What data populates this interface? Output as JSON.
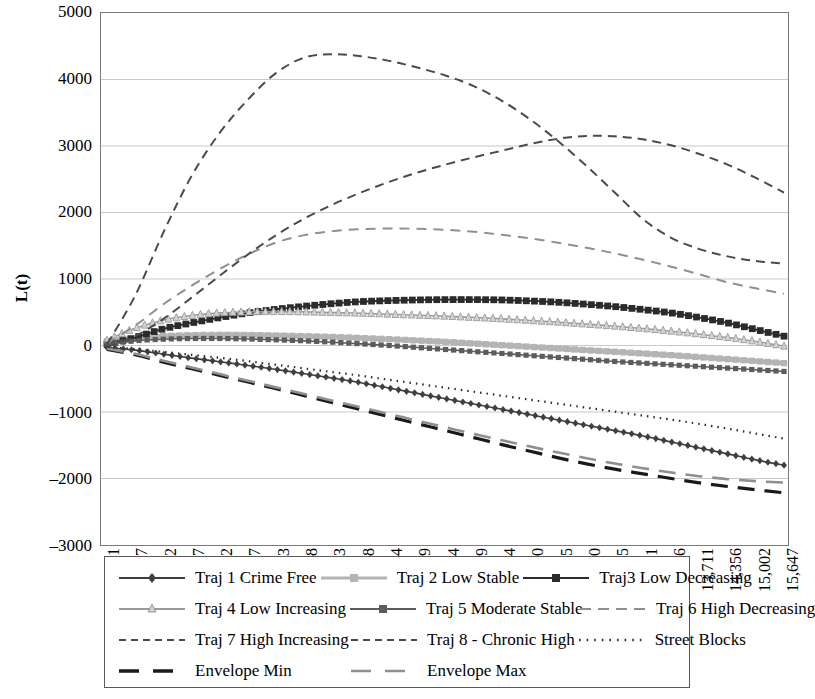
{
  "axis": {
    "y_title": "L(t)",
    "y_ticks": [
      "5000",
      "4000",
      "3000",
      "2000",
      "1000",
      "0",
      "-1000",
      "-2000",
      "-3000"
    ],
    "x_ticks": [
      "161",
      "807",
      "1,452",
      "2,097",
      "2,742",
      "3,387",
      "4,033",
      "4,678",
      "5,323",
      "5,968",
      "6,614",
      "7,259",
      "7,904",
      "8,549",
      "9,194",
      "9,840",
      "10,485",
      "11,130",
      "11,775",
      "12,421",
      "13,066",
      "13,711",
      "14,356",
      "15,002",
      "15,647"
    ]
  },
  "legend": {
    "items": [
      {
        "label": "Traj 1 Crime Free",
        "style": "marker-diamond",
        "color": "#3f3f3f"
      },
      {
        "label": "Traj 2 Low Stable",
        "style": "marker-square",
        "color": "#b4b4b4"
      },
      {
        "label": "Traj3 Low Decreasing",
        "style": "marker-square",
        "color": "#2b2b2b"
      },
      {
        "label": "Traj 4 Low Increasing",
        "style": "marker-triangle",
        "color": "#9a9a9a"
      },
      {
        "label": "Traj 5 Moderate Stable",
        "style": "marker-square",
        "color": "#5c5c5c"
      },
      {
        "label": "Traj 6 High Decreasing",
        "style": "dash-medium",
        "color": "#8f8f8f"
      },
      {
        "label": "Traj 7 High Increasing",
        "style": "dash-small",
        "color": "#4a4a4a"
      },
      {
        "label": "Traj 8 - Chronic High",
        "style": "dash-small",
        "color": "#4a4a4a"
      },
      {
        "label": "Street Blocks",
        "style": "dotted",
        "color": "#2b2b2b"
      },
      {
        "label": "Envelope Min",
        "style": "dash-long-thick",
        "color": "#1a1a1a"
      },
      {
        "label": "Envelope Max",
        "style": "dash-long",
        "color": "#8f8f8f"
      }
    ]
  },
  "chart_data": {
    "type": "line",
    "title": "",
    "xlabel": "",
    "ylabel": "L(t)",
    "ylim": [
      -3000,
      5000
    ],
    "grid": true,
    "legend_position": "bottom",
    "x": [
      161,
      807,
      1452,
      2097,
      2742,
      3387,
      4033,
      4678,
      5323,
      5968,
      6614,
      7259,
      7904,
      8549,
      9194,
      9840,
      10485,
      11130,
      11775,
      12421,
      13066,
      13711,
      14356,
      15002,
      15647
    ],
    "series": [
      {
        "name": "Traj 1 Crime Free",
        "marker": "diamond",
        "color": "#3f3f3f",
        "values": [
          -30,
          -70,
          -130,
          -190,
          -245,
          -300,
          -360,
          -425,
          -490,
          -560,
          -640,
          -720,
          -800,
          -880,
          -960,
          -1040,
          -1120,
          -1200,
          -1280,
          -1360,
          -1450,
          -1540,
          -1630,
          -1720,
          -1800
        ]
      },
      {
        "name": "Traj 2 Low Stable",
        "marker": "square",
        "color": "#b4b4b4",
        "values": [
          60,
          110,
          140,
          155,
          160,
          158,
          150,
          140,
          128,
          112,
          95,
          75,
          55,
          30,
          5,
          -20,
          -45,
          -70,
          -95,
          -120,
          -145,
          -175,
          -205,
          -235,
          -265
        ]
      },
      {
        "name": "Traj3 Low Decreasing",
        "marker": "square",
        "color": "#2b2b2b",
        "values": [
          20,
          120,
          250,
          340,
          420,
          490,
          545,
          590,
          630,
          660,
          675,
          685,
          690,
          690,
          685,
          670,
          650,
          620,
          585,
          540,
          490,
          420,
          340,
          240,
          140
        ]
      },
      {
        "name": "Traj 4 Low Increasing",
        "marker": "triangle",
        "color": "#9a9a9a",
        "values": [
          80,
          260,
          380,
          450,
          490,
          505,
          510,
          505,
          495,
          485,
          470,
          455,
          440,
          420,
          400,
          375,
          350,
          320,
          290,
          255,
          215,
          170,
          120,
          60,
          -10
        ]
      },
      {
        "name": "Traj 5 Moderate Stable",
        "marker": "square",
        "color": "#5c5c5c",
        "values": [
          20,
          70,
          95,
          105,
          105,
          98,
          85,
          70,
          50,
          25,
          0,
          -30,
          -60,
          -90,
          -120,
          -150,
          -180,
          -210,
          -240,
          -265,
          -290,
          -315,
          -340,
          -365,
          -390
        ]
      },
      {
        "name": "Traj 6 High Decreasing",
        "marker": "none",
        "color": "#8f8f8f",
        "values": [
          40,
          300,
          620,
          900,
          1150,
          1370,
          1550,
          1660,
          1720,
          1750,
          1760,
          1755,
          1740,
          1710,
          1665,
          1610,
          1545,
          1470,
          1385,
          1290,
          1185,
          1070,
          950,
          860,
          780
        ]
      },
      {
        "name": "Traj 7 High Increasing",
        "marker": "none",
        "color": "#4a4a4a",
        "values": [
          -20,
          140,
          400,
          720,
          1050,
          1370,
          1660,
          1910,
          2120,
          2300,
          2460,
          2600,
          2720,
          2830,
          2930,
          3030,
          3110,
          3150,
          3145,
          3100,
          3010,
          2880,
          2720,
          2520,
          2300
        ]
      },
      {
        "name": "Traj 8 - Chronic High",
        "marker": "none",
        "color": "#4a4a4a",
        "values": [
          20,
          750,
          1700,
          2550,
          3200,
          3700,
          4100,
          4330,
          4380,
          4350,
          4280,
          4180,
          4060,
          3900,
          3680,
          3400,
          3070,
          2700,
          2300,
          1900,
          1620,
          1450,
          1340,
          1270,
          1230
        ]
      },
      {
        "name": "Street Blocks",
        "marker": "dot",
        "color": "#2b2b2b",
        "values": [
          -20,
          -55,
          -95,
          -140,
          -185,
          -235,
          -290,
          -345,
          -400,
          -455,
          -515,
          -575,
          -635,
          -695,
          -755,
          -815,
          -875,
          -935,
          -995,
          -1055,
          -1115,
          -1180,
          -1250,
          -1325,
          -1400
        ]
      },
      {
        "name": "Envelope Min",
        "marker": "none",
        "color": "#1a1a1a",
        "values": [
          -60,
          -140,
          -250,
          -350,
          -450,
          -550,
          -650,
          -755,
          -860,
          -965,
          -1070,
          -1175,
          -1280,
          -1385,
          -1490,
          -1590,
          -1690,
          -1780,
          -1860,
          -1930,
          -2000,
          -2065,
          -2120,
          -2170,
          -2215
        ]
      },
      {
        "name": "Envelope Max",
        "marker": "none",
        "color": "#8f8f8f",
        "values": [
          -50,
          -125,
          -230,
          -330,
          -430,
          -530,
          -630,
          -730,
          -830,
          -930,
          -1030,
          -1130,
          -1230,
          -1330,
          -1425,
          -1520,
          -1610,
          -1695,
          -1775,
          -1845,
          -1910,
          -1965,
          -2010,
          -2040,
          -2060
        ]
      }
    ]
  }
}
